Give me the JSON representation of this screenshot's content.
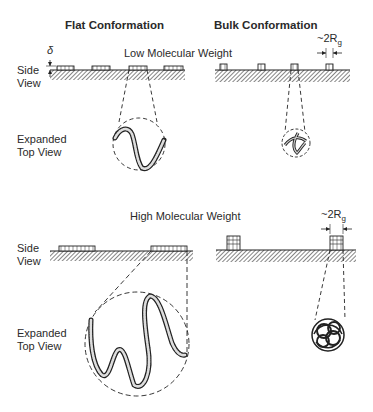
{
  "headers": {
    "flat": "Flat Conformation",
    "bulk": "Bulk Conformation"
  },
  "sections": {
    "low": "Low Molecular Weight",
    "high": "High Molecular Weight"
  },
  "labels": {
    "side_view_1": "Side",
    "side_view_2": "View",
    "expanded_1": "Expanded",
    "expanded_2": "Top View",
    "delta": "δ",
    "rg_prefix": "~2R",
    "rg_sub": "g"
  }
}
